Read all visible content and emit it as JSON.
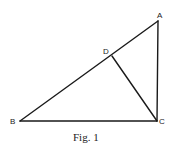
{
  "figure": {
    "caption": "Fig. 1",
    "points": {
      "A": {
        "label": "A",
        "x": 158,
        "y": 21
      },
      "B": {
        "label": "B",
        "x": 20,
        "y": 121
      },
      "C": {
        "label": "C",
        "x": 157,
        "y": 121
      },
      "D": {
        "label": "D",
        "x": 112,
        "y": 56
      }
    },
    "segments": [
      "AB",
      "BC",
      "CA",
      "DC"
    ],
    "line_color": "#1a1a1a"
  }
}
